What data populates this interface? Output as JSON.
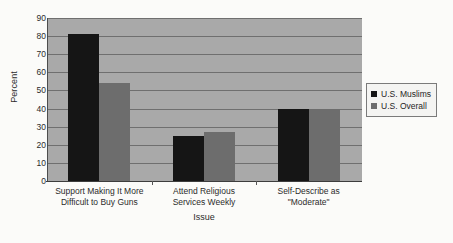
{
  "chart_data": {
    "type": "bar",
    "title": "",
    "subtitle": "",
    "xlabel": "Issue",
    "ylabel": "Percent",
    "ylim": [
      0,
      90
    ],
    "ytick_step": 10,
    "yticks": [
      90,
      80,
      70,
      60,
      50,
      40,
      30,
      20,
      10,
      0
    ],
    "grid": true,
    "grid_axis": "y",
    "legend_position": "right",
    "categories": [
      "Support Making It More Difficult to Buy Guns",
      "Attend Religious Services Weekly",
      "Self-Describe as \"Moderate\""
    ],
    "category_label_lines": [
      [
        "Support Making It More",
        "Difficult to Buy Guns"
      ],
      [
        "Attend Religious",
        "Services Weekly"
      ],
      [
        "Self-Describe as",
        "\"Moderate\""
      ]
    ],
    "series": [
      {
        "name": "U.S. Muslims",
        "color": "#151515",
        "values": [
          81,
          25,
          40
        ]
      },
      {
        "name": "U.S. Overall",
        "color": "#6d6d6d",
        "values": [
          54,
          27,
          40
        ]
      }
    ]
  },
  "colors": {
    "page_background": "#fbfbf9",
    "plot_background": "#a9a9a9",
    "gridline": "#6f6f6f",
    "axis": "#3d3d3d",
    "text": "#2b2b2b",
    "legend_background": "#f4f4f2",
    "legend_border": "#7a7a7a"
  }
}
